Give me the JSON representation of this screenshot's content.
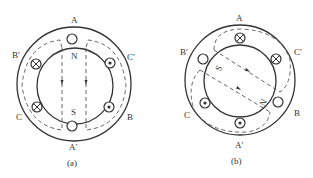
{
  "figure_a": {
    "caption": "(a)",
    "labels": {
      "A": "A",
      "A_prime": "A′",
      "B": "B",
      "B_prime": "B′",
      "C": "C",
      "C_prime": "C′"
    },
    "poles": {
      "north": "N",
      "south": "S"
    },
    "conductors": [
      {
        "pos": "A",
        "symbol": "empty"
      },
      {
        "pos": "A_prime",
        "symbol": "empty"
      },
      {
        "pos": "B_prime",
        "symbol": "cross"
      },
      {
        "pos": "C",
        "symbol": "cross"
      },
      {
        "pos": "C_prime",
        "symbol": "dot"
      },
      {
        "pos": "B",
        "symbol": "dot"
      }
    ]
  },
  "figure_b": {
    "caption": "(b)",
    "labels": {
      "A": "A",
      "A_prime": "A′",
      "B": "B",
      "B_prime": "B′",
      "C": "C",
      "C_prime": "C′"
    },
    "poles": {
      "north": "N",
      "south": "S"
    },
    "conductors": [
      {
        "pos": "A",
        "symbol": "cross"
      },
      {
        "pos": "C_prime",
        "symbol": "cross"
      },
      {
        "pos": "B_prime",
        "symbol": "empty"
      },
      {
        "pos": "B",
        "symbol": "empty"
      },
      {
        "pos": "C",
        "symbol": "dot"
      },
      {
        "pos": "A_prime",
        "symbol": "dot"
      }
    ]
  }
}
